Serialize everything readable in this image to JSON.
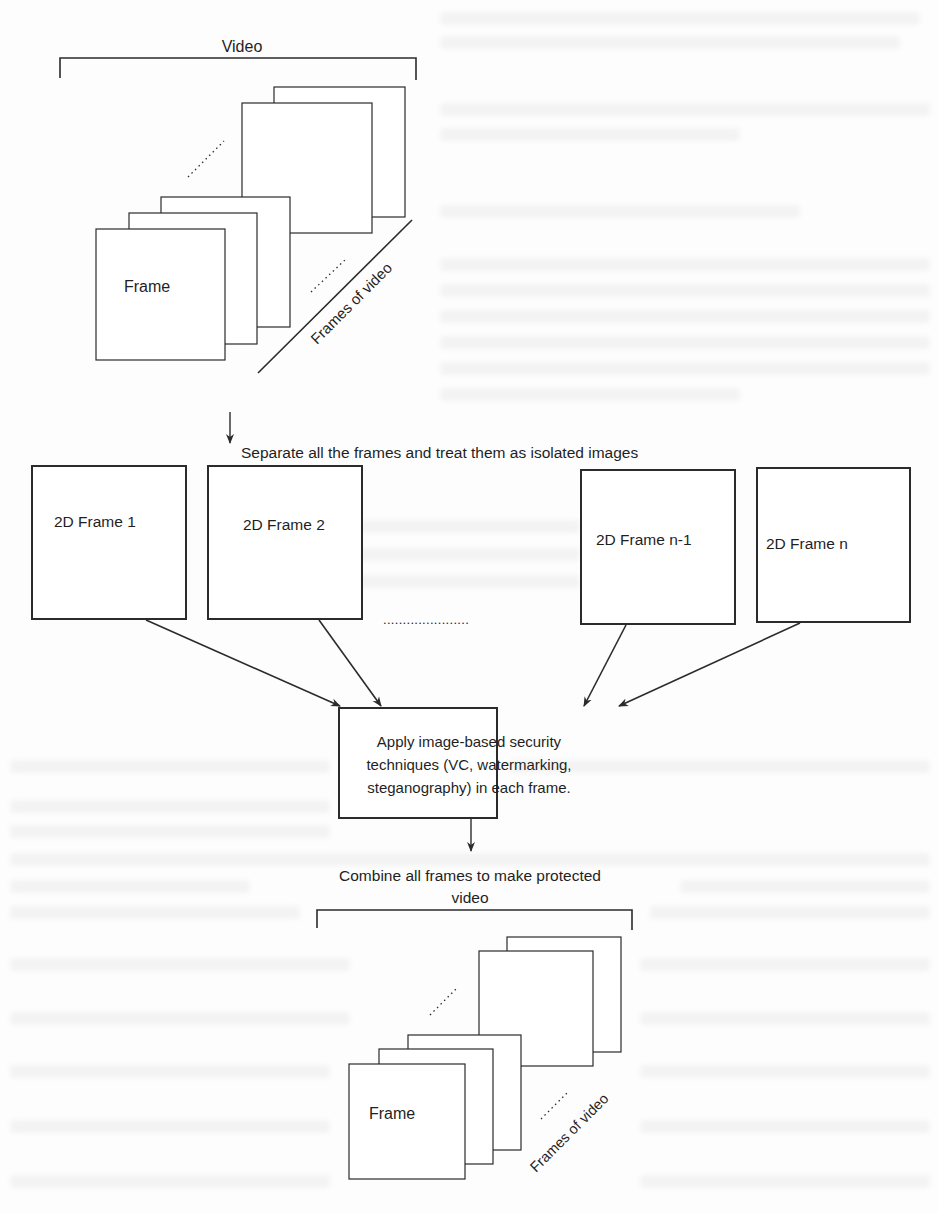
{
  "figure": {
    "top_stack": {
      "bracket_label": "Video",
      "front_frame_label": "Frame",
      "axis_label": "Frames of video"
    },
    "separate_step": {
      "label": "Separate all the frames and treat them as isolated images",
      "frames": [
        {
          "label": "2D Frame 1"
        },
        {
          "label": "2D Frame 2"
        },
        {
          "label": "2D Frame n-1"
        },
        {
          "label": "2D Frame n"
        }
      ],
      "ellipsis": "......................"
    },
    "process_box": {
      "lines": [
        "Apply image-based security",
        "techniques (VC, watermarking,",
        "steganography) in each frame."
      ]
    },
    "combine_step": {
      "label_line1": "Combine all frames to make protected",
      "label_line2": "video"
    },
    "bottom_stack": {
      "front_frame_label": "Frame",
      "axis_label": "Frames of video"
    },
    "colors": {
      "line": "#2b2b2b",
      "background": "#fdfdfd",
      "bleed_through": "#ececec"
    }
  }
}
